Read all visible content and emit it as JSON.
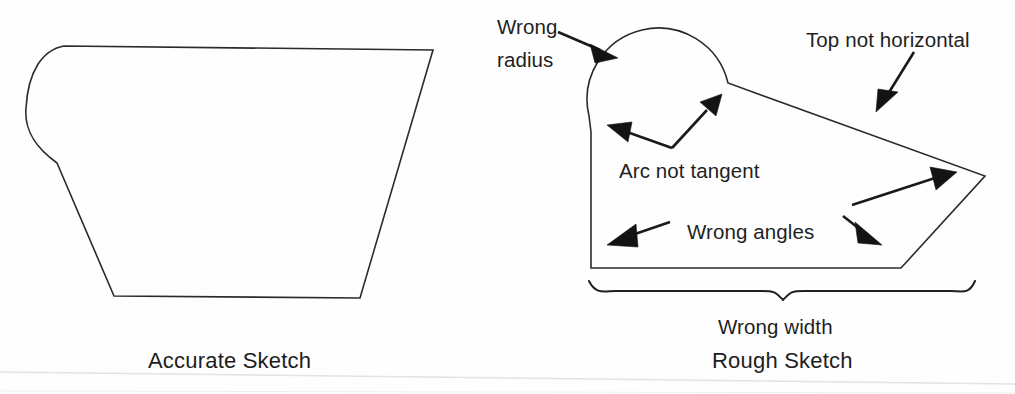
{
  "figure": {
    "background_color": "#fefefe",
    "line_color": "#2b2b2b",
    "text_color": "#1f1f1f"
  },
  "panels": {
    "left": {
      "caption": "Accurate Sketch",
      "caption_x": 148,
      "caption_y": 368,
      "shape_name": "accurate-profile-outline"
    },
    "right": {
      "caption": "Rough Sketch",
      "caption_x": 712,
      "caption_y": 368,
      "shape_name": "rough-profile-outline"
    }
  },
  "annotations": [
    {
      "id": "wrong-radius",
      "line1": "Wrong",
      "line2": "radius",
      "text": "Wrong radius",
      "x": 497,
      "y": 26,
      "y2": 59,
      "arrow_target": "arc-top-left"
    },
    {
      "id": "top-not-horizontal",
      "line1": "Top not horizontal",
      "text": "Top not horizontal",
      "x": 806,
      "y": 40,
      "arrow_target": "top-slanted-edge"
    },
    {
      "id": "arc-not-tangent",
      "line1": "Arc not tangent",
      "text": "Arc not tangent",
      "x": 619,
      "y": 172,
      "arrow_target": "arc-left-junction-and-arc-right-junction"
    },
    {
      "id": "wrong-angles",
      "line1": "Wrong angles",
      "text": "Wrong angles",
      "x": 687,
      "y": 232,
      "arrow_target": "bottom-left-corner-and-bottom-right-corner"
    },
    {
      "id": "wrong-width",
      "line1": "Wrong width",
      "text": "Wrong width",
      "x": 718,
      "y": 328,
      "arrow_target": "bottom-width-brace"
    }
  ],
  "geometry": {
    "accurate_sketch": {
      "description": "Trapezoid with large rounded radius on upper-left corner",
      "top_left_tangent": [
        64,
        46
      ],
      "top_right": [
        433,
        50
      ],
      "bottom_right": [
        360,
        298
      ],
      "bottom_left": [
        114,
        296
      ],
      "arc_left_extreme": [
        26,
        108
      ],
      "arc_bottom_tangent": [
        57,
        163
      ]
    },
    "rough_sketch": {
      "description": "Polygon with oversized non-tangent arc bump on top-left, slanted top, right point, slanted lower-right",
      "arc_center": [
        643,
        76
      ],
      "arc_radius": 46,
      "arc_right_end": [
        728,
        83
      ],
      "right_point": [
        985,
        176
      ],
      "bottom_right_corner": [
        901,
        268
      ],
      "bottom_left_corner": [
        591,
        268
      ],
      "left_edge_top": [
        591,
        132
      ],
      "brace_left": [
        589,
        281
      ],
      "brace_right": [
        975,
        281
      ],
      "brace_tip": [
        783,
        297
      ]
    }
  },
  "icons": {
    "arrowhead": "solid-triangle-arrowhead",
    "brace": "curly-brace-underline"
  }
}
